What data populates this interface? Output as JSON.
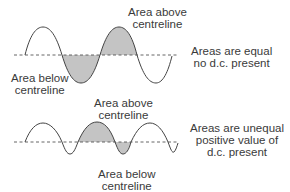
{
  "top_diagram": {
    "label_above": [
      "Area above",
      "centreline"
    ],
    "label_below": [
      "Area below",
      "centreline"
    ],
    "description": [
      "Areas are equal",
      "no d.c. present"
    ]
  },
  "bottom_diagram": {
    "label_above": [
      "Area above",
      "centreline"
    ],
    "label_below": [
      "Area below",
      "centreline"
    ],
    "description": [
      "Areas are unequal",
      "positive value of",
      "d.c. present"
    ]
  },
  "colors": {
    "line": "#444444",
    "fill": "#c4c4c4",
    "text": "#3a3a3a"
  }
}
